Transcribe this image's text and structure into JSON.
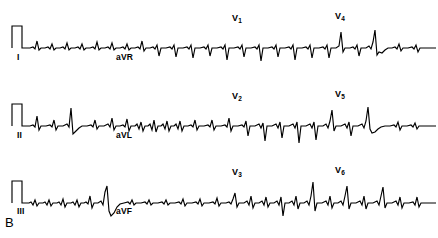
{
  "figure": {
    "panel_letter": "B",
    "background_color": "#ffffff",
    "trace_color": "#000000",
    "width": 438,
    "height": 238
  },
  "strips": [
    {
      "id": "strip-1",
      "calibration_pulse": true,
      "labels_below": [
        {
          "name": "lead-label-I",
          "text": "I",
          "x": 17,
          "y": 59
        },
        {
          "name": "lead-label-aVR",
          "text": "aVR",
          "x": 116,
          "y": 59
        }
      ],
      "labels_above": [
        {
          "name": "lead-label-V1",
          "text": "V",
          "sub": "1",
          "x": 232,
          "y": 14
        },
        {
          "name": "lead-label-V4",
          "text": "V",
          "sub": "4",
          "x": 335,
          "y": 12
        }
      ]
    },
    {
      "id": "strip-2",
      "calibration_pulse": true,
      "labels_below": [
        {
          "name": "lead-label-II",
          "text": "II",
          "x": 17,
          "y": 137
        },
        {
          "name": "lead-label-aVL",
          "text": "aVL",
          "x": 116,
          "y": 137
        }
      ],
      "labels_above": [
        {
          "name": "lead-label-V2",
          "text": "V",
          "sub": "2",
          "x": 232,
          "y": 92
        },
        {
          "name": "lead-label-V5",
          "text": "V",
          "sub": "5",
          "x": 335,
          "y": 90
        }
      ]
    },
    {
      "id": "strip-3",
      "calibration_pulse": true,
      "labels_below": [
        {
          "name": "lead-label-III",
          "text": "III",
          "x": 17,
          "y": 213
        },
        {
          "name": "lead-label-aVF",
          "text": "aVF",
          "x": 116,
          "y": 213
        }
      ],
      "labels_above": [
        {
          "name": "lead-label-V3",
          "text": "V",
          "sub": "3",
          "x": 232,
          "y": 170
        },
        {
          "name": "lead-label-V6",
          "text": "V",
          "sub": "6",
          "x": 335,
          "y": 168
        }
      ]
    }
  ],
  "chart_data": {
    "type": "line",
    "title": "",
    "xlabel": "",
    "ylabel": "",
    "grid": false,
    "legend_position": "none",
    "baseline_y": [
      48,
      126,
      203
    ],
    "calibration": {
      "label": "1 mV calibration pulse",
      "x_start": 11,
      "x_end": 23,
      "amplitude_px": 22
    },
    "series": [
      {
        "name": "strip-1",
        "baseline": 48,
        "leads": [
          "I",
          "aVR",
          "V1",
          "V4"
        ],
        "points": "12,48 12,26 22,26 22,48 26,48 30,48 33,47 35,49 37,41 39,50 41,48 45,48 48,47 50,49 52,44 54,50 56,48 60,48 63,47 65,49 67,43 69,50 71,48 75,48 78,47 80,49 82,44 84,50 86,48 90,48 93,47 95,49 97,42 99,50 101,48 105,48 108,47 110,49 112,43 114,50 116,48 120,48 123,47 125,49 127,44 129,50 131,48 135,48 138,47 140,49 142,41 144,51 146,48 150,48 153,47 155,49 157,45 159,56 161,48 166,48 170,47 172,49 174,45 176,57 178,48 183,48 187,47 189,49 191,45 193,58 195,48 200,48 204,47 206,49 208,45 210,56 212,48 217,48 221,47 223,49 225,45 227,60 229,48 234,48 238,47 240,49 242,45 244,57 246,48 251,48 255,47 257,49 259,45 261,61 263,48 268,48 272,47 274,49 276,45 278,57 280,48 285,48 289,47 291,49 293,45 295,60 297,48 302,48 306,47 308,49 310,45 312,58 314,48 319,48 323,47 325,49 327,45 329,58 331,48 336,48 339,46 341,32 343,52 345,48 350,48 353,47 355,49 357,45 359,56 361,48 366,48 369,46 371,49 373,42 375,30 377,55 379,52 382,53 385,50 388,48 392,48 395,47 397,49 399,44 401,51 403,48 408,48 412,47 414,49 416,45 418,52 420,48 425,48 430,48 436,48"
      },
      {
        "name": "strip-2",
        "baseline": 126,
        "leads": [
          "II",
          "aVL",
          "V2",
          "V5"
        ],
        "points": "12,126 12,104 22,104 22,126 26,126 30,126 33,125 35,127 37,116 39,130 41,126 46,126 50,125 52,127 54,120 56,130 58,126 63,126 67,124 69,127 71,108 73,134 76,131 79,128 82,126 87,126 91,125 93,127 95,120 97,129 99,126 104,126 108,124 110,127 112,118 114,130 116,126 120,126 123,125 125,127 127,119 129,131 131,126 135,126 137,124 139,129 141,122 143,131 145,126 148,126 150,124 152,130 154,120 156,132 158,126 161,126 163,124 165,129 167,121 169,131 171,126 174,126 176,124 178,129 180,121 182,131 184,126 188,126 191,125 193,127 195,120 197,130 199,126 204,126 208,125 210,127 212,120 214,130 216,126 221,126 225,125 227,127 229,118 231,131 233,126 238,126 242,125 244,127 246,121 248,136 250,126 255,126 259,124 261,128 263,123 265,141 267,126 272,126 276,124 278,128 280,122 282,138 284,126 289,126 293,124 295,128 297,122 299,143 301,126 306,126 310,124 312,128 314,122 316,140 318,126 323,126 326,124 328,128 330,121 332,110 334,131 336,126 341,126 345,124 347,128 349,122 351,136 353,126 358,126 362,124 364,128 366,121 368,107 370,129 372,133 375,132 378,129 381,127 385,126 390,126 394,125 396,127 398,122 400,130 402,126 407,126 411,125 413,127 415,123 417,129 419,126 425,126 430,126 436,126"
      },
      {
        "name": "strip-3",
        "baseline": 203,
        "leads": [
          "III",
          "aVF",
          "V3",
          "V6"
        ],
        "points": "12,203 12,181 22,181 22,203 26,203 29,203 31,202 33,205 35,200 37,206 39,203 43,203 45,202 47,205 49,200 51,206 53,203 57,203 59,202 61,205 63,199 65,207 67,203 71,203 73,202 75,205 77,200 79,207 81,203 84,203 86,202 88,204 90,196 92,208 94,203 98,203 101,201 103,205 105,192 107,186 109,211 111,216 114,213 117,207 120,204 124,203 128,202 130,204 132,200 134,205 136,203 141,203 145,202 147,204 149,200 151,205 153,203 158,203 162,202 164,204 166,200 168,205 170,203 175,203 179,202 181,204 183,199 185,206 187,203 192,203 196,202 198,204 200,199 202,206 204,203 209,203 213,202 215,204 217,198 219,206 221,203 226,203 229,202 231,204 233,199 235,193 237,207 239,203 244,203 247,201 249,205 251,196 253,208 255,203 259,203 262,201 264,205 266,197 268,207 270,203 274,203 277,201 279,205 281,197 283,216 285,203 289,203 292,201 294,205 296,196 298,209 300,203 304,203 307,201 309,205 311,196 313,182 315,211 317,203 322,203 326,201 328,205 330,196 332,208 334,203 338,203 341,201 343,205 345,196 347,186 349,209 351,203 356,203 360,201 362,205 364,196 366,209 368,203 373,203 377,201 379,205 381,196 383,187 385,208 387,203 392,203 396,201 398,205 400,197 402,208 404,203 409,203 413,202 415,205 417,197 419,207 421,203 427,203 432,203 436,203"
      }
    ]
  }
}
